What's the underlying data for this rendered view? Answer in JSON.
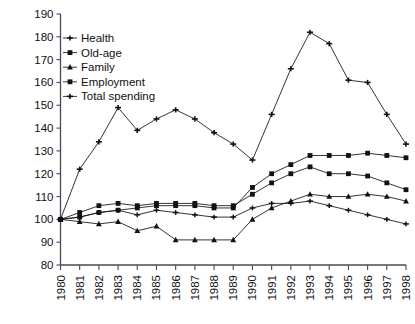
{
  "chart_data": {
    "type": "line",
    "title": "",
    "subtitle": "",
    "xlabel": "",
    "ylabel": "",
    "grid": false,
    "legend_position": "top-left",
    "xlim": [
      1980,
      1998
    ],
    "ylim": [
      80,
      190
    ],
    "ytick_step": 10,
    "yticks": [
      80,
      90,
      100,
      110,
      120,
      130,
      140,
      150,
      160,
      170,
      180,
      190
    ],
    "categories": [
      1980,
      1981,
      1982,
      1983,
      1984,
      1985,
      1986,
      1987,
      1988,
      1989,
      1990,
      1991,
      1992,
      1993,
      1994,
      1995,
      1996,
      1997,
      1998
    ],
    "x": [
      "1980",
      "1981",
      "1982",
      "1983",
      "1984",
      "1985",
      "1986",
      "1987",
      "1988",
      "1989",
      "1990",
      "1991",
      "1992",
      "1993",
      "1994",
      "1995",
      "1996",
      "1997",
      "1998"
    ],
    "series": [
      {
        "name": "Health",
        "marker": "plus",
        "values": [
          100,
          101,
          103,
          104,
          102,
          104,
          103,
          102,
          101,
          101,
          105,
          107,
          107,
          108,
          106,
          104,
          102,
          100,
          98
        ]
      },
      {
        "name": "Old-age",
        "marker": "square",
        "values": [
          100,
          101,
          103,
          104,
          105,
          106,
          106,
          106,
          105,
          105,
          114,
          120,
          124,
          128,
          128,
          128,
          129,
          128,
          127
        ]
      },
      {
        "name": "Family",
        "marker": "triangle",
        "values": [
          100,
          99,
          98,
          99,
          95,
          97,
          91,
          91,
          91,
          91,
          100,
          105,
          108,
          111,
          110,
          110,
          111,
          110,
          108
        ]
      },
      {
        "name": "Employment",
        "marker": "square",
        "values": [
          100,
          103,
          106,
          107,
          106,
          107,
          107,
          107,
          106,
          106,
          111,
          116,
          120,
          123,
          120,
          120,
          119,
          116,
          113
        ]
      },
      {
        "name": "Total spending",
        "marker": "cross",
        "values": [
          100,
          122,
          134,
          149,
          139,
          144,
          148,
          144,
          138,
          133,
          126,
          146,
          166,
          182,
          177,
          161,
          160,
          146,
          133
        ]
      }
    ]
  },
  "legend": {
    "items": [
      {
        "label": "Health"
      },
      {
        "label": "Old-age"
      },
      {
        "label": "Family"
      },
      {
        "label": "Employment"
      },
      {
        "label": "Total spending"
      }
    ]
  },
  "colors": {
    "line": "#111111",
    "axis": "#4a4a4a",
    "background": "#ffffff",
    "text": "#111111"
  }
}
